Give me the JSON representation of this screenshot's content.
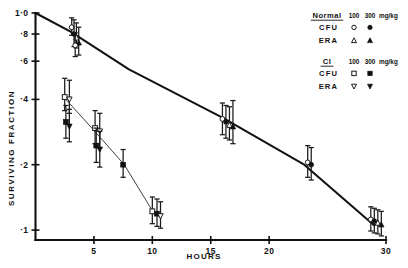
{
  "figure": {
    "name": "survival-fraction-vs-hours",
    "xlabel": "HOURS",
    "ylabel": "SURVIVING   FRACTION"
  },
  "legend": {
    "groups": [
      {
        "title": "Normal",
        "dose_100": "100",
        "dose_300": "300",
        "unit": "mg/kg",
        "rows": [
          {
            "label": "CFU",
            "marker_100": "open-circle",
            "marker_300": "filled-circle"
          },
          {
            "label": "ERA",
            "marker_100": "open-triangle",
            "marker_300": "filled-triangle"
          }
        ]
      },
      {
        "title": "CI",
        "dose_100": "100",
        "dose_300": "300",
        "unit": "mg/kg",
        "rows": [
          {
            "label": "CFU",
            "marker_100": "open-square",
            "marker_300": "filled-square"
          },
          {
            "label": "ERA",
            "marker_100": "open-inverted-triangle",
            "marker_300": "filled-inverted-triangle"
          }
        ]
      }
    ]
  },
  "chart_data": {
    "type": "line",
    "title": "",
    "xlabel": "HOURS",
    "ylabel": "SURVIVING FRACTION",
    "yscale": "log",
    "ylim": [
      0.09,
      1.0
    ],
    "xlim": [
      0,
      30
    ],
    "grid": false,
    "legend_position": "top-right",
    "xticks": [
      5,
      10,
      15,
      20,
      30
    ],
    "xticklabels": [
      "5",
      "10",
      "15",
      "20",
      "30"
    ],
    "yticks": [
      1.0,
      0.8,
      0.6,
      0.4,
      0.2,
      0.1
    ],
    "yticklabels": [
      "1·0",
      "·8",
      "·6",
      "·4",
      "·2",
      "·1"
    ],
    "series": [
      {
        "name": "Normal survival curve",
        "type": "line",
        "style": "thick",
        "x": [
          0,
          3,
          8,
          16,
          23,
          29
        ],
        "y": [
          1.0,
          0.82,
          0.55,
          0.33,
          0.2,
          0.105
        ]
      },
      {
        "name": "CI survival curve",
        "type": "line",
        "style": "thin",
        "x": [
          2.6,
          5.2,
          7.6,
          10.2
        ],
        "y": [
          0.4,
          0.28,
          0.2,
          0.118
        ]
      }
    ],
    "points": [
      {
        "series": "Normal CFU 100",
        "marker": "open-circle",
        "x": 3.1,
        "y": 0.86,
        "yerr_low": 0.79,
        "yerr_high": 0.95
      },
      {
        "series": "Normal CFU 300",
        "marker": "filled-circle",
        "x": 3.3,
        "y": 0.8,
        "yerr_low": 0.7,
        "yerr_high": 0.93
      },
      {
        "series": "Normal ERA 100",
        "marker": "open-triangle",
        "x": 3.5,
        "y": 0.77,
        "yerr_low": 0.69,
        "yerr_high": 0.9
      },
      {
        "series": "Normal ERA 300",
        "marker": "filled-triangle",
        "x": 3.7,
        "y": 0.73,
        "yerr_low": 0.64,
        "yerr_high": 0.86
      },
      {
        "series": "Normal CFU open",
        "marker": "open-circle",
        "x": 3.4,
        "y": 0.71,
        "yerr_low": 0.63,
        "yerr_high": 0.81
      },
      {
        "series": "CI CFU 100",
        "marker": "open-square",
        "x": 2.5,
        "y": 0.41,
        "yerr_low": 0.355,
        "yerr_high": 0.5
      },
      {
        "series": "CI ERA 100",
        "marker": "open-inverted-triangle",
        "x": 2.9,
        "y": 0.4,
        "yerr_low": 0.345,
        "yerr_high": 0.49
      },
      {
        "series": "CI CFU 300",
        "marker": "filled-square",
        "x": 2.6,
        "y": 0.315,
        "yerr_low": 0.265,
        "yerr_high": 0.375
      },
      {
        "series": "CI ERA 300",
        "marker": "filled-inverted-triangle",
        "x": 2.9,
        "y": 0.3,
        "yerr_low": 0.255,
        "yerr_high": 0.36
      },
      {
        "series": "CI CFU 100",
        "marker": "open-square",
        "x": 5.1,
        "y": 0.295,
        "yerr_low": 0.25,
        "yerr_high": 0.355
      },
      {
        "series": "CI ERA 100",
        "marker": "open-inverted-triangle",
        "x": 5.5,
        "y": 0.285,
        "yerr_low": 0.24,
        "yerr_high": 0.345
      },
      {
        "series": "CI CFU 300",
        "marker": "filled-square",
        "x": 5.2,
        "y": 0.245,
        "yerr_low": 0.205,
        "yerr_high": 0.295
      },
      {
        "series": "CI ERA 300",
        "marker": "filled-inverted-triangle",
        "x": 5.5,
        "y": 0.235,
        "yerr_low": 0.195,
        "yerr_high": 0.285
      },
      {
        "series": "CI CFU 300",
        "marker": "filled-square",
        "x": 7.5,
        "y": 0.2,
        "yerr_low": 0.175,
        "yerr_high": 0.235
      },
      {
        "series": "CI CFU 100",
        "marker": "open-square",
        "x": 10.0,
        "y": 0.122,
        "yerr_low": 0.107,
        "yerr_high": 0.142
      },
      {
        "series": "CI CFU 300",
        "marker": "filled-square",
        "x": 10.4,
        "y": 0.119,
        "yerr_low": 0.104,
        "yerr_high": 0.139
      },
      {
        "series": "CI ERA 100",
        "marker": "open-inverted-triangle",
        "x": 10.7,
        "y": 0.116,
        "yerr_low": 0.102,
        "yerr_high": 0.135
      },
      {
        "series": "Normal CFU 100",
        "marker": "open-circle",
        "x": 16.0,
        "y": 0.325,
        "yerr_low": 0.275,
        "yerr_high": 0.385
      },
      {
        "series": "Normal CFU 300",
        "marker": "filled-circle",
        "x": 16.3,
        "y": 0.315,
        "yerr_low": 0.265,
        "yerr_high": 0.375
      },
      {
        "series": "Normal ERA 100",
        "marker": "open-triangle",
        "x": 16.6,
        "y": 0.305,
        "yerr_low": 0.26,
        "yerr_high": 0.37
      },
      {
        "series": "Normal ERA 300",
        "marker": "filled-triangle",
        "x": 16.9,
        "y": 0.3,
        "yerr_low": 0.25,
        "yerr_high": 0.395
      },
      {
        "series": "Normal CFU 100",
        "marker": "open-circle",
        "x": 23.3,
        "y": 0.205,
        "yerr_low": 0.175,
        "yerr_high": 0.245
      },
      {
        "series": "Normal CFU 300",
        "marker": "filled-circle",
        "x": 23.6,
        "y": 0.2,
        "yerr_low": 0.17,
        "yerr_high": 0.24
      },
      {
        "series": "Normal CFU 100",
        "marker": "open-circle",
        "x": 28.7,
        "y": 0.112,
        "yerr_low": 0.099,
        "yerr_high": 0.128
      },
      {
        "series": "Normal CFU 300",
        "marker": "filled-circle",
        "x": 29.0,
        "y": 0.11,
        "yerr_low": 0.097,
        "yerr_high": 0.126
      },
      {
        "series": "Normal ERA 100",
        "marker": "open-triangle",
        "x": 29.3,
        "y": 0.108,
        "yerr_low": 0.096,
        "yerr_high": 0.124
      },
      {
        "series": "Normal ERA 300",
        "marker": "filled-triangle",
        "x": 29.6,
        "y": 0.106,
        "yerr_low": 0.094,
        "yerr_high": 0.122
      }
    ]
  }
}
